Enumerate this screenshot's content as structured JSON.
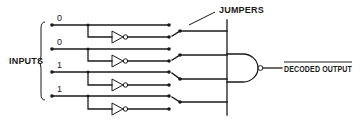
{
  "diagram": {
    "title": "",
    "labels": {
      "inputs": "INPUTS",
      "jumpers": "JUMPERS",
      "output": "DECODED OUTPUT"
    },
    "inputs": [
      {
        "bit": "0",
        "jumper_selects": "inverted"
      },
      {
        "bit": "0",
        "jumper_selects": "inverted"
      },
      {
        "bit": "1",
        "jumper_selects": "true"
      },
      {
        "bit": "1",
        "jumper_selects": "true"
      }
    ],
    "components": {
      "inverters": 4,
      "jumpers": 4,
      "gate": "NAND",
      "gate_inputs": 4
    },
    "colors": {
      "ink": "#1a1a1a",
      "background": "#ffffff"
    }
  }
}
